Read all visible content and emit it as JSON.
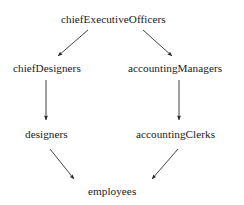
{
  "diagram": {
    "background_color": "#ffffff",
    "line_color": "#222222",
    "text_color": "#1a1a1a",
    "nodes": [
      {
        "id": "ceo",
        "label": "chiefExecutiveOfficers"
      },
      {
        "id": "cd",
        "label": "chiefDesigners"
      },
      {
        "id": "am",
        "label": "accountingManagers"
      },
      {
        "id": "des",
        "label": "designers"
      },
      {
        "id": "ac",
        "label": "accountingClerks"
      },
      {
        "id": "emp",
        "label": "employees"
      }
    ],
    "edges": [
      {
        "from": "ceo",
        "to": "cd",
        "style": "arrow"
      },
      {
        "from": "ceo",
        "to": "am",
        "style": "arrow"
      },
      {
        "from": "cd",
        "to": "des",
        "style": "arrow"
      },
      {
        "from": "am",
        "to": "ac",
        "style": "arrow"
      },
      {
        "from": "des",
        "to": "emp",
        "style": "arrow"
      },
      {
        "from": "ac",
        "to": "emp",
        "style": "arrow"
      }
    ]
  }
}
